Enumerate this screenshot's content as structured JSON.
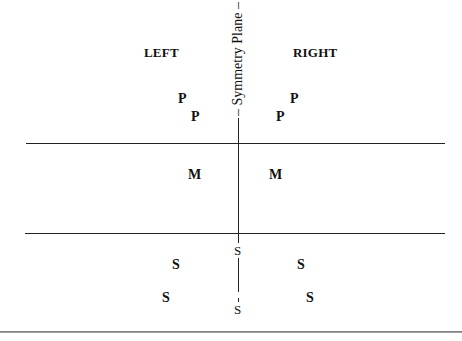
{
  "diagram": {
    "side_labels": {
      "left": "LEFT",
      "right": "RIGHT"
    },
    "axis_label": "Symmetry Plane",
    "axis_label_prefix": "–",
    "axis_label_suffix": "–",
    "markers": {
      "P": [
        {
          "label": "P",
          "side": "left",
          "x": 182,
          "y": 93
        },
        {
          "label": "P",
          "side": "left",
          "x": 190,
          "y": 110
        },
        {
          "label": "P",
          "side": "right",
          "x": 290,
          "y": 93
        },
        {
          "label": "P",
          "side": "right",
          "x": 276,
          "y": 110
        }
      ],
      "M": [
        {
          "label": "M",
          "side": "left",
          "x": 188,
          "y": 169
        },
        {
          "label": "M",
          "side": "right",
          "x": 269,
          "y": 169
        }
      ],
      "S_bold": [
        {
          "label": "S",
          "side": "left",
          "x": 172,
          "y": 258
        },
        {
          "label": "S",
          "side": "left",
          "x": 163,
          "y": 291
        },
        {
          "label": "S",
          "side": "right",
          "x": 298,
          "y": 258
        },
        {
          "label": "S",
          "side": "right",
          "x": 306,
          "y": 291
        }
      ],
      "S_axis": [
        {
          "label": "S",
          "position": "upper",
          "x": 234,
          "y": 243
        },
        {
          "label": "S",
          "position": "lower",
          "x": 234,
          "y": 302
        }
      ]
    },
    "regions": [
      "P (upper)",
      "M (middle)",
      "S (lower)"
    ]
  }
}
